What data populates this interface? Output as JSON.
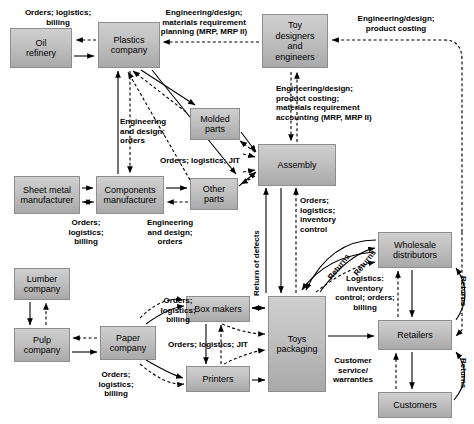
{
  "diagram": {
    "colors": {
      "node_fill_top": "#cfcfcf",
      "node_fill_bottom": "#a9a9a9",
      "node_border": "#8d8d8d",
      "line": "#000000",
      "background": "#ffffff"
    },
    "nodes": [
      {
        "id": "oil_refinery",
        "label": "Oil\nrefinery",
        "x": 10,
        "y": 28,
        "w": 62,
        "h": 40
      },
      {
        "id": "plastics_company",
        "label": "Plastics\ncompany",
        "x": 98,
        "y": 22,
        "w": 62,
        "h": 46
      },
      {
        "id": "toy_designers",
        "label": "Toy\ndesigners\nand\nengineers",
        "x": 262,
        "y": 14,
        "w": 66,
        "h": 54
      },
      {
        "id": "molded_parts",
        "label": "Molded\nparts",
        "x": 190,
        "y": 108,
        "w": 50,
        "h": 32
      },
      {
        "id": "assembly",
        "label": "Assembly",
        "x": 258,
        "y": 144,
        "w": 78,
        "h": 42
      },
      {
        "id": "sheet_metal",
        "label": "Sheet metal\nmanufacturer",
        "x": 14,
        "y": 176,
        "w": 66,
        "h": 38
      },
      {
        "id": "components_mfr",
        "label": "Components\nmanufacturer",
        "x": 96,
        "y": 176,
        "w": 68,
        "h": 38
      },
      {
        "id": "other_parts",
        "label": "Other\nparts",
        "x": 190,
        "y": 178,
        "w": 48,
        "h": 32
      },
      {
        "id": "lumber_company",
        "label": "Lumber\ncompany",
        "x": 14,
        "y": 268,
        "w": 56,
        "h": 32
      },
      {
        "id": "pulp_company",
        "label": "Pulp\ncompany",
        "x": 14,
        "y": 328,
        "w": 56,
        "h": 34
      },
      {
        "id": "paper_company",
        "label": "Paper\ncompany",
        "x": 100,
        "y": 326,
        "w": 56,
        "h": 34
      },
      {
        "id": "box_makers",
        "label": "Box makers",
        "x": 186,
        "y": 296,
        "w": 64,
        "h": 26
      },
      {
        "id": "printers",
        "label": "Printers",
        "x": 186,
        "y": 366,
        "w": 64,
        "h": 26
      },
      {
        "id": "toys_packaging",
        "label": "Toys\npackaging",
        "x": 268,
        "y": 296,
        "w": 58,
        "h": 96
      },
      {
        "id": "wholesale_distributors",
        "label": "Wholesale\ndistributors",
        "x": 378,
        "y": 232,
        "w": 74,
        "h": 36
      },
      {
        "id": "retailers",
        "label": "Retailers",
        "x": 378,
        "y": 320,
        "w": 74,
        "h": 30
      },
      {
        "id": "customers",
        "label": "Customers",
        "x": 378,
        "y": 392,
        "w": 74,
        "h": 26
      }
    ],
    "edge_labels": [
      {
        "id": "lbl_orders_logistics_billing_oil",
        "text": "Orders; logistics;\nbilling",
        "x": 16,
        "y": 8,
        "w": 84,
        "align": "c"
      },
      {
        "id": "lbl_eng_mrp",
        "text": "Engineering/design;\nmaterials requirement\nplanning (MRP, MRP II)",
        "x": 152,
        "y": 8,
        "w": 104,
        "align": "c"
      },
      {
        "id": "lbl_eng_product_costing",
        "text": "Engineering/design;\nproduct costing",
        "x": 346,
        "y": 14,
        "w": 100,
        "align": "c"
      },
      {
        "id": "lbl_eng_product_mra",
        "text": "Engineering/design;\nproduct costing;\nmaterials requirement\naccounting (MRP, MRP II)",
        "x": 276,
        "y": 84,
        "w": 110,
        "align": "l"
      },
      {
        "id": "lbl_eng_design_orders_plastics",
        "text": "Engineering\nand design;\norders",
        "x": 120,
        "y": 117,
        "w": 56,
        "align": "l"
      },
      {
        "id": "lbl_orders_logistics_jit_molded",
        "text": "Orders; logistics; JIT",
        "x": 152,
        "y": 156,
        "w": 96,
        "align": "c"
      },
      {
        "id": "lbl_orders_logistics_billing_sheet",
        "text": "Orders;\nlogistics;\nbilling",
        "x": 58,
        "y": 218,
        "w": 56,
        "align": "c"
      },
      {
        "id": "lbl_eng_design_orders_comp",
        "text": "Engineering\nand design;\norders",
        "x": 142,
        "y": 218,
        "w": 56,
        "align": "c"
      },
      {
        "id": "lbl_orders_logistics_inventory",
        "text": "Orders;\nlogistics;\ninventory\ncontrol",
        "x": 298,
        "y": 196,
        "w": 56,
        "align": "l"
      },
      {
        "id": "lbl_return_of_defects",
        "text": "Return of defects",
        "x": 246,
        "y": 292,
        "w": 80,
        "align": "l",
        "rotate": -90
      },
      {
        "id": "lbl_returns_a",
        "text": "Returns",
        "x": 330,
        "y": 280,
        "w": 40,
        "align": "l",
        "rotate": 55
      },
      {
        "id": "lbl_returns_b",
        "text": "Returns",
        "x": 356,
        "y": 268,
        "w": 40,
        "align": "l",
        "rotate": 55
      },
      {
        "id": "lbl_logistics_inventory_orders",
        "text": "Logistics:\ninventory\ncontrol; orders;\nbilling",
        "x": 326,
        "y": 272,
        "w": 72,
        "align": "c"
      },
      {
        "id": "lbl_orders_logistics_billing_paper",
        "text": "Orders;\nlogistics;\nbilling",
        "x": 176,
        "y": 296,
        "w": 56,
        "align": "c"
      },
      {
        "id": "lbl_orders_logistics_jit_box",
        "text": "Orders; logistics; JIT",
        "x": 176,
        "y": 340,
        "w": 96,
        "align": "c"
      },
      {
        "id": "lbl_orders_logistics_billing_print",
        "text": "Orders;\nlogistics;\nbilling",
        "x": 88,
        "y": 372,
        "w": 56,
        "align": "c"
      },
      {
        "id": "lbl_customer_service",
        "text": "Customer\nservice/\nwarranties",
        "x": 322,
        "y": 356,
        "w": 62,
        "align": "c"
      },
      {
        "id": "lbl_returns_c",
        "text": "Returns",
        "x": 466,
        "y": 258,
        "w": 40,
        "align": "l",
        "rotate": 90
      },
      {
        "id": "lbl_returns_d",
        "text": "Returns",
        "x": 466,
        "y": 348,
        "w": 40,
        "align": "l",
        "rotate": 90
      }
    ]
  }
}
